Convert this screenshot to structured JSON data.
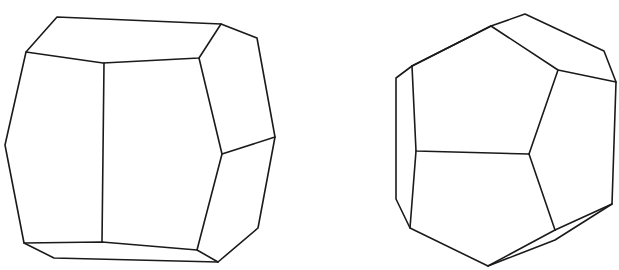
{
  "figures": [
    {
      "name": "crystal-left",
      "outline": [
        [
          57,
          17
        ],
        [
          221,
          24
        ],
        [
          257,
          38
        ],
        [
          275,
          137
        ],
        [
          258,
          228
        ],
        [
          218,
          262
        ],
        [
          54,
          258
        ],
        [
          24,
          243
        ],
        [
          5,
          145
        ],
        [
          26,
          52
        ]
      ],
      "edges": [
        [
          [
            26,
            52
          ],
          [
            103,
            63
          ],
          [
            199,
            58
          ],
          [
            221,
            24
          ]
        ],
        [
          [
            104,
            63
          ],
          [
            102,
            242
          ]
        ],
        [
          [
            199,
            58
          ],
          [
            222,
            154
          ],
          [
            275,
            137
          ]
        ],
        [
          [
            222,
            154
          ],
          [
            197,
            250
          ],
          [
            218,
            262
          ]
        ],
        [
          [
            24,
            243
          ],
          [
            102,
            242
          ],
          [
            197,
            250
          ]
        ]
      ]
    },
    {
      "name": "crystal-right",
      "outline": [
        [
          491,
          26
        ],
        [
          525,
          14
        ],
        [
          604,
          51
        ],
        [
          616,
          82
        ],
        [
          612,
          204
        ],
        [
          555,
          240
        ],
        [
          488,
          266
        ],
        [
          410,
          228
        ],
        [
          396,
          199
        ],
        [
          396,
          78
        ],
        [
          412,
          66
        ]
      ],
      "edges": [
        [
          [
            412,
            66
          ],
          [
            491,
            26
          ]
        ],
        [
          [
            491,
            26
          ],
          [
            558,
            70
          ],
          [
            616,
            82
          ]
        ],
        [
          [
            558,
            70
          ],
          [
            529,
            154
          ]
        ],
        [
          [
            412,
            66
          ],
          [
            416,
            151
          ],
          [
            529,
            154
          ]
        ],
        [
          [
            529,
            154
          ],
          [
            555,
            230
          ]
        ],
        [
          [
            416,
            151
          ],
          [
            410,
            228
          ]
        ],
        [
          [
            555,
            230
          ],
          [
            612,
            204
          ]
        ],
        [
          [
            488,
            266
          ],
          [
            555,
            230
          ]
        ]
      ]
    }
  ]
}
